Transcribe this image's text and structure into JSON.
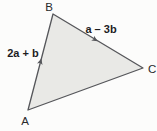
{
  "figure": {
    "background_color": "#fcfcfb",
    "triangle": {
      "fill_color": "#e9e9e6",
      "stroke_color": "#55565a",
      "vertices": {
        "A": {
          "label": "A"
        },
        "B": {
          "label": "B"
        },
        "C": {
          "label": "C"
        }
      }
    },
    "edge_labels": {
      "ab": {
        "text": "2a + b",
        "parts": [
          "2",
          "a",
          " + ",
          "b"
        ]
      },
      "bc": {
        "text": "a – 3b",
        "parts": [
          "a",
          " – ",
          "3",
          "b"
        ]
      }
    },
    "arrow_color": "#55565a"
  }
}
